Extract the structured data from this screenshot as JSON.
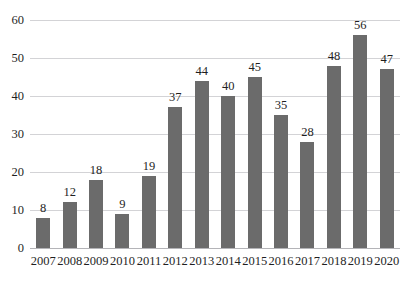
{
  "chart_data": {
    "type": "bar",
    "title": "",
    "subtitle": "",
    "xlabel": "",
    "ylabel": "",
    "categories": [
      "2007",
      "2008",
      "2009",
      "2010",
      "2011",
      "2012",
      "2013",
      "2014",
      "2015",
      "2016",
      "2017",
      "2018",
      "2019",
      "2020"
    ],
    "values": [
      8,
      12,
      18,
      9,
      19,
      37,
      44,
      40,
      45,
      35,
      28,
      48,
      56,
      47
    ],
    "data_labels": [
      "8",
      "12",
      "18",
      "9",
      "19",
      "37",
      "44",
      "40",
      "45",
      "35",
      "28",
      "48",
      "56",
      "47"
    ],
    "ylim": [
      0,
      60
    ],
    "y_ticks": [
      0,
      10,
      20,
      30,
      40,
      50,
      60
    ],
    "y_tick_labels": [
      "0",
      "10",
      "20",
      "30",
      "40",
      "50",
      "60"
    ],
    "grid": true,
    "grid_axis": "y",
    "legend": null,
    "legend_position": "none",
    "series": [
      {
        "name": "",
        "values": [
          8,
          12,
          18,
          9,
          19,
          37,
          44,
          40,
          45,
          35,
          28,
          48,
          56,
          47
        ],
        "color": "#6b6b6b"
      }
    ],
    "colors": {
      "bar": "#6b6b6b",
      "gridline": "#d3d3d6",
      "axis": "#b4b4b8",
      "text": "#1f1f1f",
      "background": "#ffffff"
    }
  },
  "clipped_top_text": ""
}
